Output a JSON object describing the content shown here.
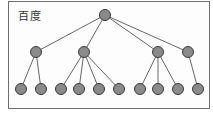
{
  "title": "百度",
  "colors": {
    "node_fill": "#8a8a8a",
    "node_stroke": "#3a3a3a",
    "edge": "#555555",
    "border": "#6e6e6e"
  },
  "tree": {
    "root": {
      "id": "r",
      "x": 105,
      "y": 15
    },
    "level1": [
      {
        "id": "a",
        "x": 36,
        "y": 52
      },
      {
        "id": "b",
        "x": 84,
        "y": 52
      },
      {
        "id": "c",
        "x": 158,
        "y": 52
      },
      {
        "id": "d",
        "x": 188,
        "y": 52
      }
    ],
    "level2": [
      {
        "id": "a1",
        "parent": "a",
        "x": 21,
        "y": 89
      },
      {
        "id": "a2",
        "parent": "a",
        "x": 41,
        "y": 89
      },
      {
        "id": "b1",
        "parent": "b",
        "x": 61,
        "y": 89
      },
      {
        "id": "b2",
        "parent": "b",
        "x": 79,
        "y": 89
      },
      {
        "id": "b3",
        "parent": "b",
        "x": 99,
        "y": 89
      },
      {
        "id": "b4",
        "parent": "b",
        "x": 119,
        "y": 89
      },
      {
        "id": "c1",
        "parent": "c",
        "x": 140,
        "y": 89
      },
      {
        "id": "c2",
        "parent": "c",
        "x": 158,
        "y": 89
      },
      {
        "id": "c3",
        "parent": "c",
        "x": 178,
        "y": 89
      },
      {
        "id": "d1",
        "parent": "d",
        "x": 198,
        "y": 89
      }
    ]
  },
  "node_radius": 5.5
}
